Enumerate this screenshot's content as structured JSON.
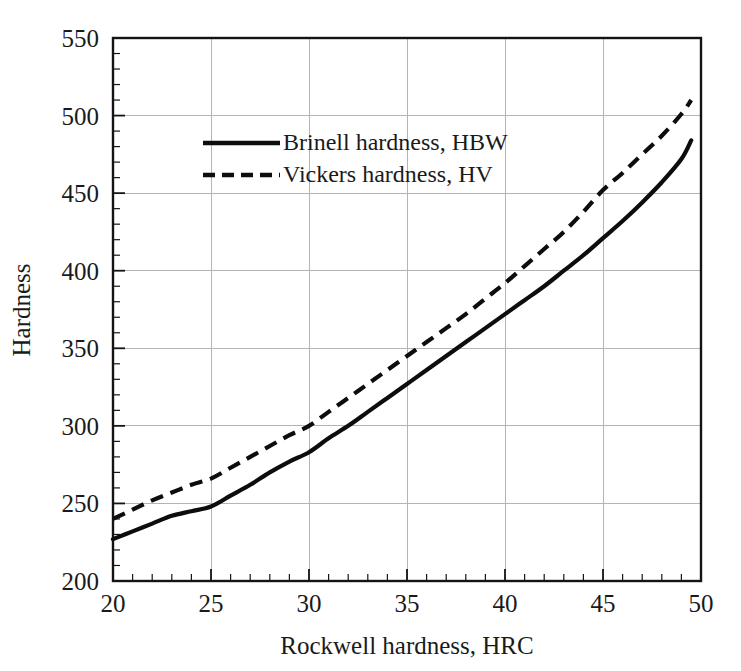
{
  "chart_data": {
    "type": "line",
    "title": "",
    "xlabel": "Rockwell hardness, HRC",
    "ylabel": "Hardness",
    "xlim": [
      20,
      50
    ],
    "ylim": [
      200,
      550
    ],
    "x_major_step": 5,
    "x_minor_step": 1,
    "y_major_step": 50,
    "y_minor_step": 10,
    "xticks": [
      "20",
      "25",
      "30",
      "35",
      "40",
      "45",
      "50"
    ],
    "yticks": [
      "200",
      "250",
      "300",
      "350",
      "400",
      "450",
      "500",
      "550"
    ],
    "grid": "both-major",
    "legend_position": "upper-left-inside",
    "background_color": "#ffffff",
    "line_color": "#0d0d0d",
    "grid_color": "#b4b4b4",
    "axis_color": "#141414",
    "x": [
      20,
      21,
      22,
      23,
      24,
      25,
      26,
      27,
      28,
      29,
      30,
      31,
      32,
      33,
      34,
      35,
      36,
      37,
      38,
      39,
      40,
      41,
      42,
      43,
      44,
      45,
      46,
      47,
      48,
      49,
      49.5
    ],
    "series": [
      {
        "name": "Brinell hardness, HBW",
        "style": "solid",
        "values": [
          227,
          232,
          237,
          242,
          245,
          248,
          255,
          262,
          270,
          277,
          283,
          292,
          300,
          309,
          318,
          327,
          336,
          345,
          354,
          363,
          372,
          381,
          390,
          400,
          410,
          421,
          432,
          444,
          457,
          472,
          484
        ]
      },
      {
        "name": "Vickers hardness, HV",
        "style": "dashed",
        "values": [
          240,
          246,
          252,
          257,
          262,
          266,
          273,
          280,
          287,
          294,
          300,
          309,
          318,
          327,
          336,
          345,
          354,
          363,
          372,
          382,
          392,
          403,
          414,
          425,
          438,
          452,
          463,
          475,
          487,
          501,
          510
        ]
      }
    ]
  },
  "legend": {
    "items": [
      {
        "label": "Brinell hardness, HBW",
        "style": "solid"
      },
      {
        "label": "Vickers hardness, HV",
        "style": "dashed"
      }
    ]
  },
  "axes": {
    "x_title": "Rockwell hardness, HRC",
    "y_title": "Hardness",
    "x_tick_labels": [
      "20",
      "25",
      "30",
      "35",
      "40",
      "45",
      "50"
    ],
    "y_tick_labels": [
      "200",
      "250",
      "300",
      "350",
      "400",
      "450",
      "500",
      "550"
    ]
  }
}
